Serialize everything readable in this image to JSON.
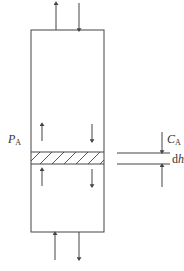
{
  "diagram": {
    "type": "column-differential-element",
    "colors": {
      "stroke": "#444444",
      "text": "#333333",
      "background": "#ffffff"
    },
    "labels": {
      "pressure": {
        "main": "P",
        "sub": "A"
      },
      "concentration": {
        "main": "C",
        "sub": "A"
      },
      "thickness": {
        "main": "d",
        "italic": "h"
      }
    },
    "column": {
      "x": 31,
      "y": 30,
      "width": 73,
      "height": 202
    },
    "element": {
      "y_top": 152,
      "y_bottom": 164,
      "hatch": "diagonal"
    },
    "arrows": [
      {
        "name": "top-outflow-arrow",
        "direction": "up"
      },
      {
        "name": "top-inflow-arrow",
        "direction": "down"
      },
      {
        "name": "upper-up-arrow",
        "direction": "up"
      },
      {
        "name": "upper-down-arrow",
        "direction": "down"
      },
      {
        "name": "lower-up-arrow",
        "direction": "up"
      },
      {
        "name": "lower-down-arrow",
        "direction": "down"
      },
      {
        "name": "bottom-inflow-arrow",
        "direction": "up"
      },
      {
        "name": "bottom-outflow-arrow",
        "direction": "down"
      }
    ]
  }
}
